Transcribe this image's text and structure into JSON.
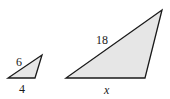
{
  "figure": {
    "fill_color": "#e6e6e6",
    "stroke_color": "#1a1a1a",
    "small_triangle": {
      "side_label_slanted": "6",
      "side_label_base": "4",
      "vertices": [
        [
          8,
          78
        ],
        [
          35,
          78
        ],
        [
          42,
          55
        ]
      ]
    },
    "large_triangle": {
      "side_label_slanted": "18",
      "side_label_base": "x",
      "vertices": [
        [
          66,
          78
        ],
        [
          145,
          78
        ],
        [
          162,
          10
        ]
      ]
    }
  }
}
